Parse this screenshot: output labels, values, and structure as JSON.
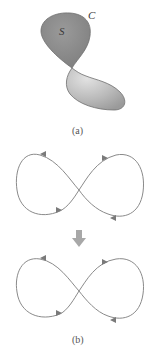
{
  "figure": {
    "panel_a": {
      "caption": "(a)",
      "surface_label": "S",
      "curve_label": "C",
      "colors": {
        "surface_dark": "#8f8f8f",
        "surface_light": "#c9c9c9",
        "outline": "#6e6e6e"
      }
    },
    "transition_arrow": {
      "direction": "down",
      "color": "#a8a8a8"
    },
    "panel_b": {
      "caption": "(b)",
      "curves": [
        {
          "name": "figure-eight-top",
          "arrows": [
            "left-lobe-top",
            "left-lobe-bottom",
            "right-lobe-top",
            "right-lobe-bottom"
          ]
        },
        {
          "name": "figure-eight-bottom",
          "arrows": [
            "left-lobe-top",
            "left-lobe-bottom",
            "right-lobe-top",
            "right-lobe-bottom"
          ]
        }
      ],
      "colors": {
        "curve": "#8a8a8a",
        "arrowhead": "#7a7a7a"
      }
    }
  }
}
